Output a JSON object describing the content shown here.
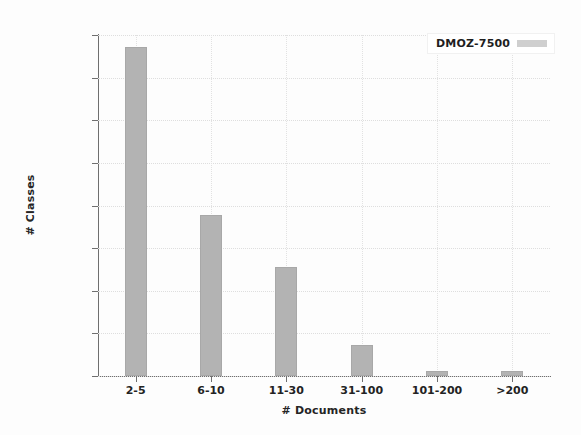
{
  "chart_data": {
    "type": "bar",
    "title": "",
    "subtitle": "",
    "xlabel": "# Documents",
    "ylabel": "# Classes",
    "categories": [
      "2-5",
      "6-10",
      "11-30",
      "31-100",
      "101-200",
      ">200"
    ],
    "values": [
      3860,
      1890,
      1280,
      365,
      60,
      55
    ],
    "series": [
      {
        "name": "DMOZ-7500",
        "values": [
          3860,
          1890,
          1280,
          365,
          60,
          55
        ]
      }
    ],
    "ylim": [
      0,
      4000
    ],
    "ytick_labels": [
      "0",
      "500",
      "1000",
      "1500",
      "2000",
      "2500",
      "3000",
      "3500",
      "4000"
    ],
    "ytick_values": [
      0,
      500,
      1000,
      1500,
      2000,
      2500,
      3000,
      3500,
      4000
    ],
    "grid": true,
    "legend_position": "top-right",
    "legend_entries": [
      "DMOZ-7500"
    ],
    "colors": {
      "bar_fill": "#b3b3b3",
      "bar_edge": "#a8a8a8",
      "legend_swatch": "#cfcfcf",
      "axis": "#6f6f6f",
      "grid": "#dedede",
      "text": "#232323",
      "background": "#fdfdfd"
    }
  },
  "legend": {
    "label": "DMOZ-7500"
  }
}
